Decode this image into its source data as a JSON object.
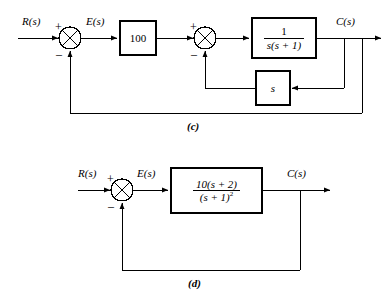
{
  "figure": {
    "kind": "control-system-block-diagrams",
    "panels": [
      {
        "id": "c",
        "caption": "(c)",
        "input_label": "R(s)",
        "error_label": "E(s)",
        "output_label": "C(s)",
        "summers": [
          {
            "name": "outer-summing-junction",
            "plus": "+",
            "minus": "–"
          },
          {
            "name": "inner-summing-junction",
            "plus": "+",
            "minus": "–"
          }
        ],
        "blocks": [
          {
            "name": "gain-block",
            "text": "100"
          },
          {
            "name": "plant-block",
            "numerator": "1",
            "denominator": "s(s + 1)"
          },
          {
            "name": "rate-feedback-block",
            "text": "s"
          }
        ]
      },
      {
        "id": "d",
        "caption": "(d)",
        "input_label": "R(s)",
        "error_label": "E(s)",
        "output_label": "C(s)",
        "summers": [
          {
            "name": "summing-junction",
            "plus": "+",
            "minus": "–"
          }
        ],
        "blocks": [
          {
            "name": "plant-block",
            "numerator": "10(s + 2)",
            "denominator": "(s + 1)",
            "denominator_exponent": "2"
          }
        ]
      }
    ]
  },
  "colors": {
    "line": "#000000",
    "background": "#ffffff"
  }
}
